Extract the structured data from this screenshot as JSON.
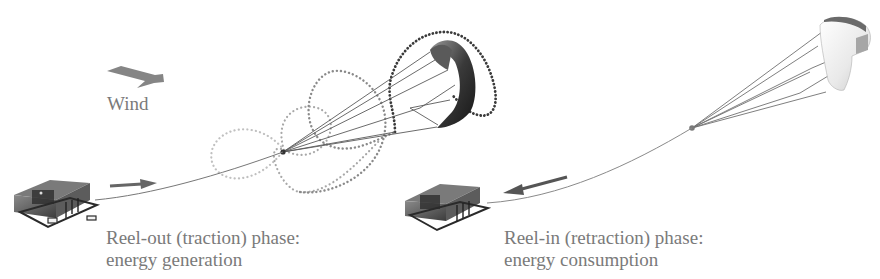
{
  "wind": {
    "label": "Wind"
  },
  "phases": [
    {
      "id": "reel-out",
      "title": "Reel-out (traction) phase:",
      "subtitle": "energy generation"
    },
    {
      "id": "reel-in",
      "title": "Reel-in (retraction) phase:",
      "subtitle": "energy consumption"
    }
  ],
  "colors": {
    "text": "#7a7a7a",
    "arrow": "#6e6e6e",
    "tether": "#777777",
    "path_light": "#b5b5b5",
    "path_mid": "#8a8a8a",
    "path_dark": "#3a3a3a",
    "kite_dark": "#2e2e2e",
    "kite_light": "#e2e2e2",
    "station": "#555555"
  }
}
